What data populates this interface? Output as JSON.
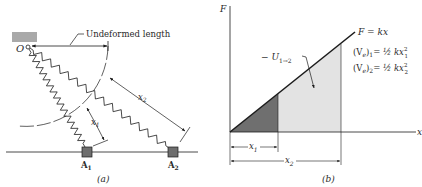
{
  "panel_a": {
    "caption": "(a)",
    "point_o": "O",
    "undeformed_label": "Undeformed length",
    "block_1_label": "A",
    "block_1_sub": "1",
    "block_2_label": "A",
    "block_2_sub": "2",
    "dim_x1": "x",
    "dim_x1_sub": "1",
    "dim_x2": "x",
    "dim_x2_sub": "2"
  },
  "panel_b": {
    "caption": "(b)",
    "y_axis_label": "F",
    "x_axis_label": "x",
    "line_label": "F = kx",
    "work_label": "− U",
    "work_sub": "1→2",
    "eq1_lhs": "(V",
    "eq1_e": "e",
    "eq1_close": ")",
    "eq1_sub": "1",
    "eq1_rhs": "= ½ kx",
    "eq1_sup": "2",
    "eq1_rsub": "1",
    "eq2_lhs": "(V",
    "eq2_e": "e",
    "eq2_close": ")",
    "eq2_sub": "2",
    "eq2_rhs": "= ½ kx",
    "eq2_sup": "2",
    "eq2_rsub": "2",
    "tick_x1": "x",
    "tick_x1_sub": "1",
    "tick_x2": "x",
    "tick_x2_sub": "2"
  },
  "colors": {
    "ink": "#1c1c1c",
    "block_fill": "#6e6e6e",
    "ceiling_fill": "#a9a9a9",
    "dark_area": "#6f6f6f",
    "light_area": "#e3e3e3"
  }
}
